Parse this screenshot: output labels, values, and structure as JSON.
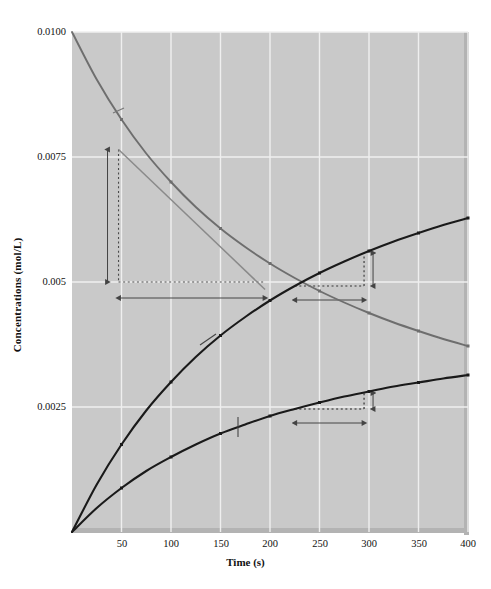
{
  "chart_data": {
    "type": "line",
    "title": "",
    "xlabel": "Time (s)",
    "ylabel": "Concentrations (mol/L)",
    "xlim": [
      0,
      400
    ],
    "ylim": [
      0,
      0.01
    ],
    "xticks": [
      "50",
      "100",
      "150",
      "200",
      "250",
      "300",
      "350",
      "400"
    ],
    "xtick_values": [
      50,
      100,
      150,
      200,
      250,
      300,
      350,
      400
    ],
    "yticks": [
      "0.0025",
      "0.005",
      "0.0075",
      "0.0100"
    ],
    "ytick_values": [
      0.0025,
      0.005,
      0.0075,
      0.01
    ],
    "grid": true,
    "legend_position": "inline-labels",
    "x": [
      0,
      25,
      50,
      75,
      100,
      125,
      150,
      175,
      200,
      225,
      250,
      275,
      300,
      325,
      350,
      375,
      400
    ],
    "series": [
      {
        "name": "NO2",
        "label": "NO₂",
        "color": "#6e6e6e",
        "values": [
          0.01,
          0.00905,
          0.00825,
          0.00757,
          0.007,
          0.0065,
          0.00607,
          0.0057,
          0.00537,
          0.00508,
          0.00482,
          0.00459,
          0.00438,
          0.00419,
          0.00402,
          0.00386,
          0.00372
        ]
      },
      {
        "name": "NO",
        "label": "NO",
        "color": "#1a1a1a",
        "values": [
          0.0,
          0.00095,
          0.00175,
          0.00243,
          0.003,
          0.0035,
          0.00393,
          0.0043,
          0.00463,
          0.00492,
          0.00518,
          0.00541,
          0.00562,
          0.00581,
          0.00598,
          0.00614,
          0.00628
        ]
      },
      {
        "name": "O2",
        "label": "O₂",
        "color": "#1a1a1a",
        "values": [
          0.0,
          0.00048,
          0.00088,
          0.00122,
          0.0015,
          0.00175,
          0.00197,
          0.00215,
          0.00232,
          0.00246,
          0.00259,
          0.00271,
          0.00281,
          0.00291,
          0.00299,
          0.00307,
          0.00314
        ]
      }
    ],
    "tangent_line": {
      "name": "NO2-tangent",
      "x1": 47,
      "y1": 0.00765,
      "x2": 195,
      "y2": 0.00485,
      "color": "#8a8a8a"
    },
    "annotations": [
      {
        "id": "delta-no2",
        "text": "Δ[NO₂]",
        "kind": "label"
      },
      {
        "id": "delta-no2-value",
        "text": "0.0026",
        "kind": "measure"
      },
      {
        "id": "delta-t",
        "text": "Δt",
        "kind": "label"
      },
      {
        "id": "delta-t-value",
        "text": "110 s",
        "kind": "measure"
      },
      {
        "id": "no-rise",
        "text": "0.0006",
        "kind": "measure"
      },
      {
        "id": "no-run",
        "text": "70 s",
        "kind": "measure"
      },
      {
        "id": "o2-rise",
        "text": "0.0003",
        "kind": "measure"
      },
      {
        "id": "o2-run",
        "text": "70 s",
        "kind": "measure"
      }
    ]
  },
  "axis": {
    "ylabel": "Concentrations (mol/L)",
    "xlabel": "Time (s)",
    "yticks": [
      "0.0100",
      "0.0075",
      "0.005",
      "0.0025"
    ],
    "xticks": [
      "50",
      "100",
      "150",
      "200",
      "250",
      "300",
      "350",
      "400"
    ]
  },
  "labels": {
    "no2": "NO₂",
    "no": "NO",
    "o2": "O₂"
  },
  "annotations": {
    "delta_no2": "Δ[NO₂]",
    "delta_no2_value": "0.0026",
    "delta_t": "Δt",
    "delta_t_value": "110 s",
    "no_rise": "0.0006",
    "no_run": "70 s",
    "o2_rise": "0.0003",
    "o2_run": "70 s"
  },
  "colors": {
    "plot_background": "#c9c9c9",
    "grid": "#efefef",
    "no2_curve": "#6e6e6e",
    "no_curve": "#1a1a1a",
    "o2_curve": "#1a1a1a",
    "tangent": "#8a8a8a",
    "annotation": "#3a3a3a"
  }
}
